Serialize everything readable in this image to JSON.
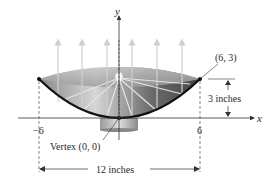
{
  "diagram": {
    "axes": {
      "x_label": "x",
      "y_label": "y",
      "x_ticks": [
        "−6",
        "6"
      ]
    },
    "points": {
      "vertex_label": "Vertex (0, 0)",
      "rim_point_label": "(6, 3)"
    },
    "dimensions": {
      "depth_label": "3 inches",
      "width_label": "12 inches"
    },
    "colors": {
      "curve": "#111111",
      "bowl_dark": "#5a5a5a",
      "bowl_light": "#d8d8d8",
      "rays": "#cfcfcf",
      "axis": "#333333"
    }
  }
}
